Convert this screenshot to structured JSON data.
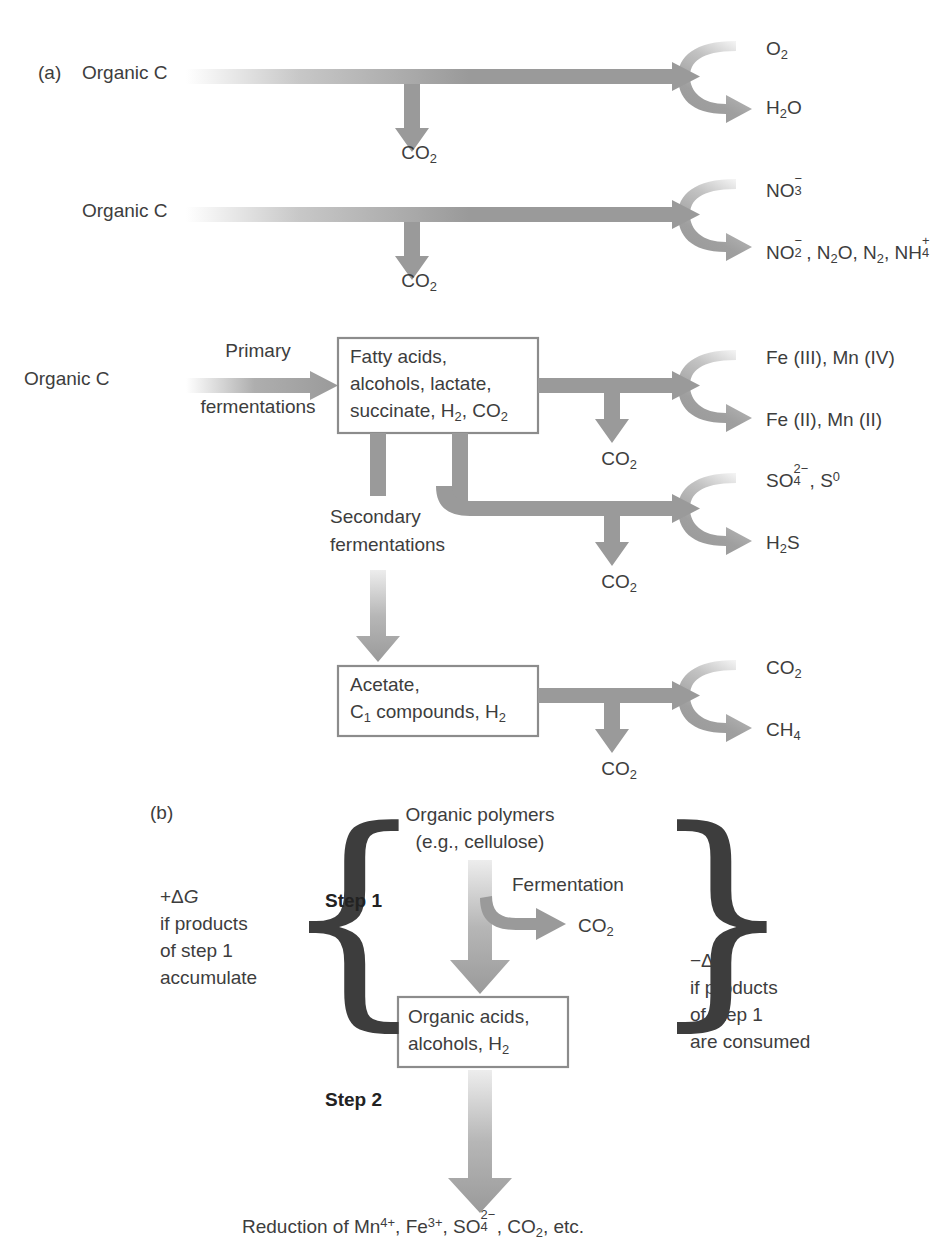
{
  "figure": {
    "panels": [
      {
        "id": "a",
        "label": "(a)"
      },
      {
        "id": "b",
        "label": "(b)"
      }
    ]
  },
  "colors": {
    "arrow_gray": "#9a9a9a",
    "arrow_gray_light": "#c9c9c9",
    "box_border": "#8c8c8c",
    "text": "#3d3d3d",
    "background": "#ffffff"
  },
  "panel_a": {
    "label": "(a)",
    "rows": [
      {
        "id": "aerobic-respiration",
        "source_label": "Organic C",
        "byproduct_label": "CO2",
        "byproduct_formula": {
          "base": "CO",
          "sub": "2"
        },
        "oxidant_label": "O2",
        "oxidant_formula": {
          "base": "O",
          "sub": "2"
        },
        "product_label": "H2O",
        "product_formula": {
          "base": "H",
          "sub": "2",
          "tail": "O"
        }
      },
      {
        "id": "nitrate-reduction",
        "source_label": "Organic C",
        "byproduct_label": "CO2",
        "oxidant_label": "NO3-",
        "product_label": "NO2-, N2O, N2, NH4+"
      },
      {
        "id": "metal-reduction",
        "source_label": "Organic C",
        "process_label": "Primary fermentations",
        "process_line1": "Primary",
        "process_line2": "fermentations",
        "byproduct_label": "CO2",
        "oxidant_label": "Fe (III), Mn (IV)",
        "product_label": "Fe (II), Mn (II)"
      },
      {
        "id": "sulfate-reduction",
        "byproduct_label": "CO2",
        "oxidant_label": "SO42-, S0",
        "product_label": "H2S"
      },
      {
        "id": "methanogenesis",
        "byproduct_label": "CO2",
        "oxidant_label": "CO2",
        "product_label": "CH4"
      }
    ],
    "boxes": [
      {
        "id": "fatty-acids-box",
        "lines": [
          "Fatty acids,",
          "alcohols, lactate,",
          "succinate, H2, CO2"
        ]
      },
      {
        "id": "acetate-box",
        "lines": [
          "Acetate,",
          "C1 compounds, H2"
        ]
      }
    ],
    "secondary_fermentations": {
      "line1": "Secondary",
      "line2": "fermentations"
    }
  },
  "panel_b": {
    "label": "(b)",
    "top_label_line1": "Organic polymers",
    "top_label_line2": "(e.g., cellulose)",
    "step1_label": "Step 1",
    "step2_label": "Step 2",
    "fermentation_label": "Fermentation",
    "co2_label": "CO2",
    "middle_box": {
      "id": "organic-acids-box",
      "lines": [
        "Organic acids,",
        "alcohols, H2"
      ]
    },
    "left_note": {
      "line1": "+ΔG",
      "line2": "if products",
      "line3": "of step 1",
      "line4": "accumulate"
    },
    "right_note": {
      "line1": "−ΔG",
      "line2": "if products",
      "line3": "of step 1",
      "line4": "are consumed"
    },
    "bottom_label": "Reduction of Mn4+, Fe3+, SO42-, CO2, etc."
  }
}
